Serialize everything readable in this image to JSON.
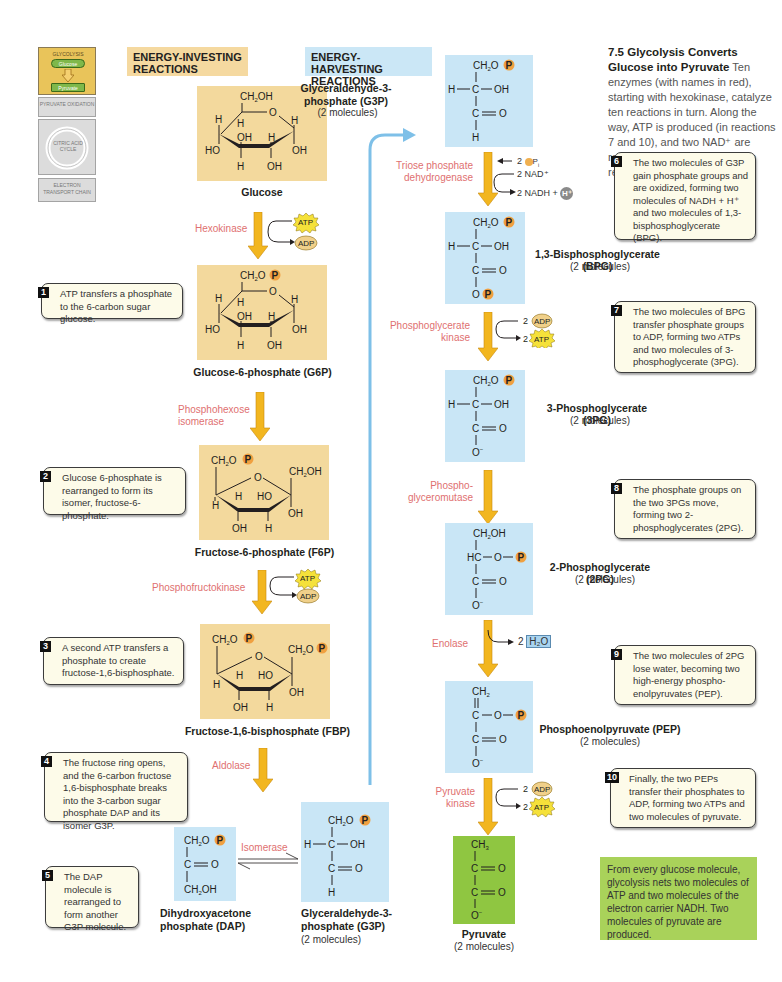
{
  "overview": {
    "glycolysis": "GLYCOLYSIS",
    "glucose": "Glucose",
    "pyruvate": "Pyruvate",
    "pyruvate_oxidation": "PYRUVATE OXIDATION",
    "citric_acid_cycle": "CITRIC ACID CYCLE",
    "electron_transport_chain": "ELECTRON TRANSPORT CHAIN"
  },
  "headers": {
    "investing": "ENERGY-INVESTING REACTIONS",
    "harvesting": "ENERGY-HARVESTING REACTIONS"
  },
  "intro": {
    "title": "7.5 Glycolysis Converts Glucose into Pyruvate",
    "body": "Ten enzymes (with names in red), starting with hexokinase, catalyze ten reactions in turn. Along the way, ATP is produced (in reactions 7 and 10), and two NAD⁺ are reduced to two NADH + H⁺ (in reaction 6)."
  },
  "molecules": {
    "glucose": {
      "name": "Glucose"
    },
    "g6p": {
      "name": "Glucose-6-phosphate (G6P)"
    },
    "f6p": {
      "name": "Fructose-6-phosphate (F6P)"
    },
    "fbp": {
      "name": "Fructose-1,6-bisphosphate (FBP)"
    },
    "dap": {
      "name": "Dihydroxyacetone phosphate (DAP)"
    },
    "g3p_bottom": {
      "name": "Glyceraldehyde-3-phosphate (G3P)",
      "count": "(2 molecules)"
    },
    "g3p_top": {
      "name": "Glyceraldehyde-3-phosphate (G3P)",
      "count": "(2 molecules)"
    },
    "bpg": {
      "name": "1,3-Bisphosphoglycerate (BPG)",
      "count": "(2 molecules)"
    },
    "pg3": {
      "name": "3-Phosphoglycerate (3PG)",
      "count": "(2 molecules)"
    },
    "pg2": {
      "name": "2-Phosphoglycerate (2PG)",
      "count": "(2 molecules)"
    },
    "pep": {
      "name": "Phosphoenolpyruvate (PEP)",
      "count": "(2 molecules)"
    },
    "pyruvate": {
      "name": "Pyruvate",
      "count": "(2 molecules)"
    }
  },
  "enzymes": {
    "hexokinase": "Hexokinase",
    "phosphohexose_isomerase": "Phosphohexose isomerase",
    "phosphofructokinase": "Phosphofructokinase",
    "aldolase": "Aldolase",
    "isomerase": "Isomerase",
    "triose_phosphate_dehydrogenase": "Triose phosphate dehydrogenase",
    "phosphoglycerate_kinase": "Phosphoglycerate kinase",
    "phosphoglyceromutase": "Phospho-glyceromutase",
    "enolase": "Enolase",
    "pyruvate_kinase": "Pyruvate kinase"
  },
  "cofactors": {
    "atp": "ATP",
    "adp": "ADP",
    "pi": "2 Pi",
    "nad": "2 NAD⁺",
    "nadh": "2 NADH +",
    "h": "H⁺",
    "two": "2",
    "water": "H₂O",
    "phosphate": "P"
  },
  "notes": [
    {
      "num": "1",
      "text": "ATP transfers a phosphate to the 6-carbon sugar glucose."
    },
    {
      "num": "2",
      "text": "Glucose 6-phosphate is rearranged to form its isomer, fructose-6-phosphate."
    },
    {
      "num": "3",
      "text": "A second ATP transfers a phosphate to create fructose-1,6-bisphosphate."
    },
    {
      "num": "4",
      "text": "The fructose ring opens, and the 6-carbon fructose 1,6-bisphosphate breaks into the 3-carbon sugar phosphate DAP and its isomer G3P."
    },
    {
      "num": "5",
      "text": "The DAP molecule is rearranged to form another G3P molecule."
    },
    {
      "num": "6",
      "text": "The two molecules of G3P gain phosphate groups and are oxidized, forming two molecules of NADH + H⁺ and two molecules of 1,3-bisphosphoglycerate (BPG)."
    },
    {
      "num": "7",
      "text": "The two molecules of BPG transfer phosphate groups to ADP, forming two ATPs and two molecules of 3-phosphoglycerate (3PG)."
    },
    {
      "num": "8",
      "text": "The phosphate groups on the two 3PGs move, forming two 2-phosphoglycerates (2PG)."
    },
    {
      "num": "9",
      "text": "The two molecules of 2PG lose water, becoming two high-energy phospho-enolpyruvates (PEP)."
    },
    {
      "num": "10",
      "text": "Finally, the two PEPs transfer their phosphates to ADP, forming two ATPs and two molecules of pyruvate."
    }
  ],
  "summary": "From every glucose molecule, glycolysis nets two molecules of ATP and two molecules of the electron carrier NADH. Two molecules of pyruvate are produced.",
  "colors": {
    "investing_bg": "#f3d99d",
    "harvesting_bg": "#c9e6f6",
    "pyruvate_bg": "#8fc641",
    "summary_bg": "#a9d25a",
    "enzyme_text": "#e07070",
    "arrow": "#f2b61f",
    "connector": "#7ec0e8",
    "phosphate": "#f0a040",
    "atp": "#f5e13a",
    "adp": "#f0d08a"
  }
}
